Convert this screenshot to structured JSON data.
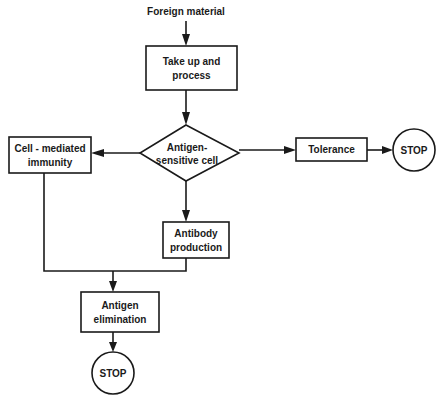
{
  "diagram": {
    "input_label": "Foreign material",
    "nodes": {
      "take_up": {
        "line1": "Take up and",
        "line2": "process"
      },
      "decision": {
        "line1": "Antigen-",
        "line2": "sensitive cell"
      },
      "cell_mediated": {
        "line1": "Cell - mediated",
        "line2": "immunity"
      },
      "tolerance": {
        "label": "Tolerance"
      },
      "stop_right": {
        "label": "STOP"
      },
      "antibody": {
        "line1": "Antibody",
        "line2": "production"
      },
      "elimination": {
        "line1": "Antigen",
        "line2": "elimination"
      },
      "stop_bottom": {
        "label": "STOP"
      }
    },
    "edges": [
      {
        "from": "Foreign material",
        "to": "Take up and process"
      },
      {
        "from": "Take up and process",
        "to": "Antigen-sensitive cell"
      },
      {
        "from": "Antigen-sensitive cell",
        "to": "Cell - mediated immunity"
      },
      {
        "from": "Antigen-sensitive cell",
        "to": "Tolerance"
      },
      {
        "from": "Tolerance",
        "to": "STOP"
      },
      {
        "from": "Antigen-sensitive cell",
        "to": "Antibody production"
      },
      {
        "from": "Cell - mediated immunity",
        "to": "Antigen elimination"
      },
      {
        "from": "Antibody production",
        "to": "Antigen elimination"
      },
      {
        "from": "Antigen elimination",
        "to": "STOP"
      }
    ]
  }
}
